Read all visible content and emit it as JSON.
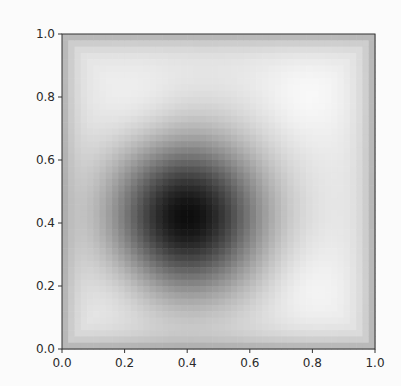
{
  "chart_data": {
    "type": "heatmap",
    "title": "",
    "xlabel": "",
    "ylabel": "",
    "xlim": [
      0.0,
      1.0
    ],
    "ylim": [
      0.0,
      1.0
    ],
    "x_ticks": [
      "0.0",
      "0.2",
      "0.4",
      "0.6",
      "0.8",
      "1.0"
    ],
    "y_ticks": [
      "0.0",
      "0.2",
      "0.4",
      "0.6",
      "0.8",
      "1.0"
    ],
    "colormap": "gray",
    "grid": false,
    "legend": null,
    "features": [
      {
        "kind": "minimum",
        "x": 0.4,
        "y": 0.42,
        "radius": 0.2,
        "value": 0.05
      },
      {
        "kind": "bright",
        "x": 0.25,
        "y": 0.75,
        "value": 0.97
      },
      {
        "kind": "bright",
        "x": 0.78,
        "y": 0.8,
        "value": 0.97
      },
      {
        "kind": "bright",
        "x": 0.2,
        "y": 0.2,
        "value": 0.96
      },
      {
        "kind": "bright",
        "x": 0.78,
        "y": 0.2,
        "value": 0.97
      },
      {
        "kind": "edge-dark",
        "value": 0.45
      }
    ],
    "grid_resolution": 50
  },
  "plot": {
    "left": 62,
    "top": 34,
    "right": 375,
    "bottom": 349
  }
}
